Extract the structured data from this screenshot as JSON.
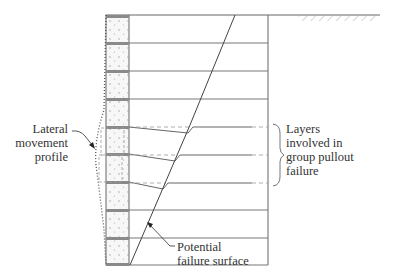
{
  "diagram": {
    "type": "reinforced soil wall cross-section",
    "colors": {
      "line": "#555555",
      "panel_fill": "#f6f6f6",
      "panel_band": "#888888",
      "dash": "#999999",
      "text": "#333333"
    },
    "wall": {
      "panel_count": 9,
      "top_y": 15,
      "bottom_y": 265,
      "panel_left_x": 106,
      "panel_right_x": 129,
      "reinforced_zone_right_x": 268,
      "ground_line_end_x": 380
    },
    "reinforcement_layer_y": [
      15,
      43,
      71,
      99,
      127,
      154,
      182,
      210,
      238,
      265
    ],
    "deflected_layers": [
      127,
      154,
      182
    ]
  },
  "labels": {
    "lateral_movement": {
      "lines": [
        "Lateral",
        "movement",
        "profile"
      ]
    },
    "group_pullout": {
      "lines": [
        "Layers",
        "involved in",
        "group pullout",
        "failure"
      ]
    },
    "failure_surface": {
      "lines": [
        "Potential",
        "failure surface"
      ]
    }
  }
}
